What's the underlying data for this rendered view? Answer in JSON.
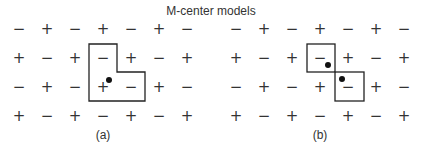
{
  "title": "M-center models",
  "panels": [
    {
      "label": "(a)",
      "x0": 19,
      "grid": [
        [
          "−",
          "+",
          "−",
          "+",
          "−",
          "+",
          "−"
        ],
        [
          "+",
          "−",
          "+",
          "−",
          "+",
          "−",
          "+"
        ],
        [
          "−",
          "+",
          "−",
          "+",
          "−",
          "+",
          "−"
        ],
        [
          "+",
          "−",
          "+",
          "−",
          "+",
          "−",
          "+"
        ]
      ],
      "outline": "L-shaped",
      "dots": 1
    },
    {
      "label": "(b)",
      "x0": 236,
      "grid": [
        [
          "−",
          "+",
          "−",
          "+",
          "−",
          "+",
          "−"
        ],
        [
          "+",
          "−",
          "+",
          "−",
          "+",
          "−",
          "+"
        ],
        [
          "−",
          "+",
          "−",
          "+",
          "−",
          "+",
          "−"
        ],
        [
          "+",
          "−",
          "+",
          "−",
          "+",
          "−",
          "+"
        ]
      ],
      "outline": "two-diagonal-squares",
      "dots": 2
    }
  ],
  "colors": {
    "line": "#222222",
    "text": "#333333",
    "background": "#ffffff"
  }
}
